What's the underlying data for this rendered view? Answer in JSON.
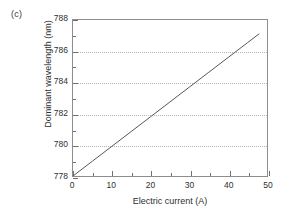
{
  "figure": {
    "panel_label": "(c)"
  },
  "chart_data": {
    "type": "line",
    "title": "",
    "xlabel": "Electric current (A)",
    "ylabel": "Dominant wavelength (nm)",
    "xlim": [
      0,
      50
    ],
    "ylim": [
      778,
      788
    ],
    "xticks": [
      0,
      10,
      20,
      30,
      40,
      50
    ],
    "xtick_labels": [
      "0",
      "10",
      "20",
      "30",
      "40",
      "50"
    ],
    "xminor_step": 5,
    "yticks": [
      778,
      780,
      782,
      784,
      786,
      788
    ],
    "ytick_labels": [
      "778",
      "780",
      "782",
      "784",
      "786",
      "788"
    ],
    "yminor_step": 1,
    "grid": {
      "horizontal": true,
      "vertical": false,
      "style": "dotted",
      "at": [
        780,
        782,
        784,
        786
      ]
    },
    "legend": null,
    "series": [
      {
        "name": "Dominant wavelength vs current",
        "color": "#555555",
        "x": [
          0,
          5,
          10,
          15,
          20,
          25,
          30,
          35,
          40,
          45,
          48
        ],
        "y": [
          778.0,
          778.95,
          779.9,
          780.85,
          781.8,
          782.75,
          783.7,
          784.65,
          785.6,
          786.55,
          787.12
        ]
      }
    ]
  }
}
